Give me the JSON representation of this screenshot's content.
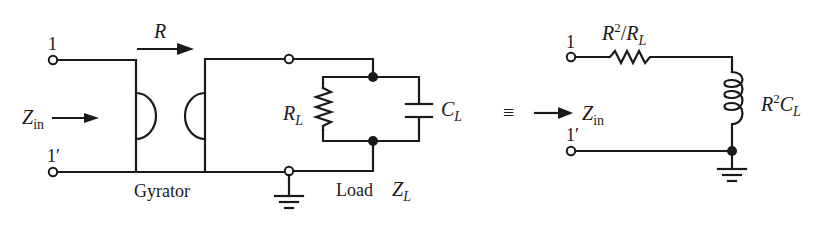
{
  "figure": {
    "type": "circuit-diagram",
    "colors": {
      "ink": "#1a1a1a",
      "background": "#ffffff"
    }
  },
  "left_circuit": {
    "terminal_top": "1",
    "terminal_bottom": "1′",
    "input_impedance": {
      "symbol": "Z",
      "subscript": "in"
    },
    "gyrator": {
      "label": "Gyrator",
      "resistance_label": "R"
    },
    "load": {
      "label": "Load",
      "impedance": {
        "symbol": "Z",
        "subscript": "L"
      },
      "resistor": {
        "symbol": "R",
        "subscript": "L"
      },
      "capacitor": {
        "symbol": "C",
        "subscript": "L"
      }
    }
  },
  "equivalence_symbol": "≡",
  "right_circuit": {
    "terminal_top": "1",
    "terminal_bottom": "1′",
    "input_impedance": {
      "symbol": "Z",
      "subscript": "in"
    },
    "series_resistor": {
      "num": "R",
      "num_sup": "2",
      "slash": "/",
      "den": "R",
      "den_sub": "L"
    },
    "inductor": {
      "sym1": "R",
      "sup": "2",
      "sym2": "C",
      "sub": "L"
    }
  }
}
